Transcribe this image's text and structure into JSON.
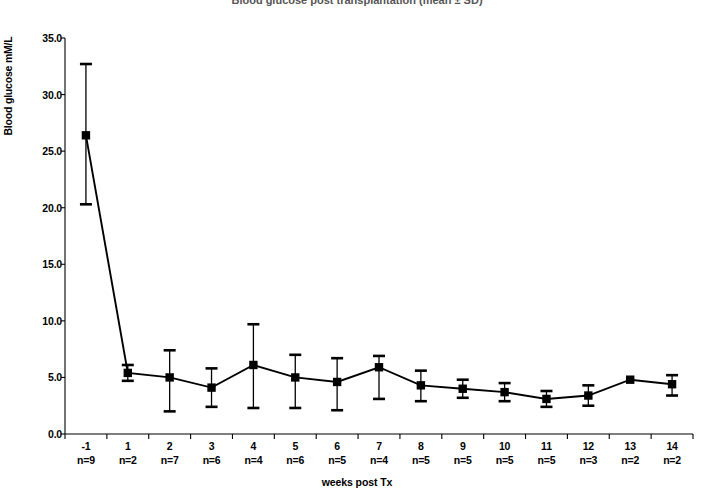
{
  "chart_data": {
    "type": "line",
    "title": "Blood glucose post transplantation (mean ± SD)",
    "xlabel": "weeks post Tx",
    "ylabel": "Blood glucose mM/L",
    "categories": [
      "-1",
      "1",
      "2",
      "3",
      "4",
      "5",
      "6",
      "7",
      "8",
      "9",
      "10",
      "11",
      "12",
      "13",
      "14"
    ],
    "group_sizes": [
      "n=9",
      "n=2",
      "n=7",
      "n=6",
      "n=4",
      "n=6",
      "n=5",
      "n=4",
      "n=5",
      "n=5",
      "n=5",
      "n=5",
      "n=3",
      "n=2",
      "n=2"
    ],
    "series": [
      {
        "name": "Blood glucose",
        "values": [
          26.4,
          5.4,
          5.0,
          4.1,
          6.1,
          5.0,
          4.6,
          5.9,
          4.3,
          4.0,
          3.7,
          3.1,
          3.4,
          4.8,
          4.4
        ],
        "err_upper": [
          32.7,
          6.1,
          7.4,
          5.8,
          9.7,
          7.0,
          6.7,
          6.9,
          5.6,
          4.8,
          4.5,
          3.8,
          4.3,
          4.8,
          5.2
        ],
        "err_lower": [
          20.3,
          4.7,
          2.0,
          2.4,
          2.3,
          2.3,
          2.1,
          3.1,
          2.9,
          3.2,
          2.9,
          2.4,
          2.5,
          4.8,
          3.4
        ]
      }
    ],
    "ylim": [
      0.0,
      35.0
    ],
    "ytick_step": 5.0,
    "ytick_labels": [
      "0.0",
      "5.0",
      "10.0",
      "15.0",
      "20.0",
      "25.0",
      "30.0",
      "35.0"
    ],
    "grid": false,
    "legend": "none",
    "marker": "square",
    "line_color": "#000000",
    "marker_color": "#000000"
  }
}
